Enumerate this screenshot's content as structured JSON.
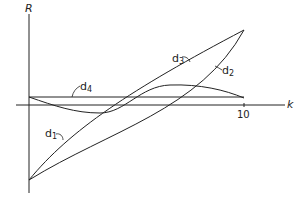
{
  "diagram": {
    "axis_labels": {
      "y": "R",
      "x": "k"
    },
    "x_ticks": [
      {
        "label": "10",
        "value": 10
      }
    ],
    "curves": [
      {
        "id": "d1",
        "letter": "d",
        "subscript": "1",
        "description": "concave curve from origin-bottom rising steeply to top-right endpoint"
      },
      {
        "id": "d2",
        "letter": "d",
        "subscript": "2",
        "description": "straight/convex curve from bottom-left to top-right endpoint"
      },
      {
        "id": "d3",
        "letter": "d",
        "subscript": "3",
        "description": "sinusoid-like curve dipping below axis then peaking above it, ending near axis at k=10"
      },
      {
        "id": "d4",
        "letter": "d",
        "subscript": "4",
        "description": "horizontal line slightly above the k axis"
      }
    ],
    "colors": {
      "stroke": "#222222",
      "background": "#ffffff"
    }
  }
}
